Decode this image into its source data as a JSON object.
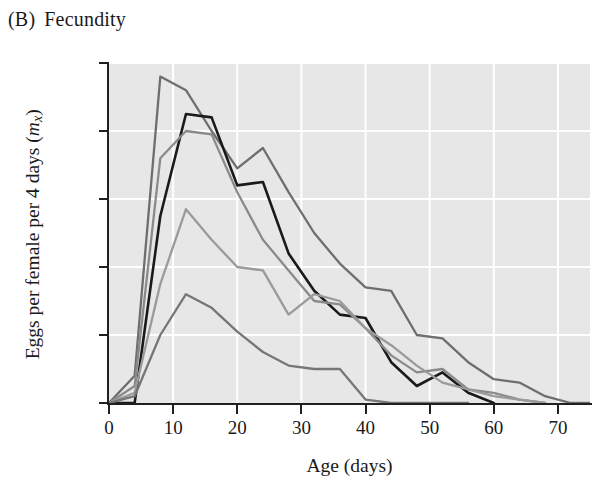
{
  "figure": {
    "panel_letter": "(B)",
    "panel_title": "Fecundity"
  },
  "axes": {
    "x_title": "Age (days)",
    "y_title_main": "Eggs per female per 4 days (",
    "y_title_symbol": "m",
    "y_title_subscript": "x",
    "y_title_close": ")",
    "x_ticks": [
      "0",
      "10",
      "20",
      "30",
      "40",
      "50",
      "60",
      "70"
    ],
    "y_ticks": [
      "0",
      "20",
      "40",
      "60",
      "80",
      "100"
    ]
  },
  "colors": {
    "plot_background": "#e7e7e7",
    "gridline": "#ffffff",
    "axis": "#202020",
    "series_1": "#6e6e6e",
    "series_2": "#1a1a1a",
    "series_3": "#8a8a8a",
    "series_4": "#9a9a9a",
    "series_5": "#767676"
  },
  "chart_data": {
    "type": "line",
    "xlabel": "Age (days)",
    "ylabel": "Eggs per female per 4 days (mx)",
    "xlim": [
      0,
      75
    ],
    "ylim": [
      0,
      100
    ],
    "xticks": [
      0,
      10,
      20,
      30,
      40,
      50,
      60,
      70
    ],
    "yticks": [
      0,
      20,
      40,
      60,
      80,
      100
    ],
    "grid": true,
    "legend": "none",
    "series": [
      {
        "name": "Population 1",
        "color": "#6e6e6e",
        "x": [
          0,
          4,
          8,
          12,
          16,
          20,
          24,
          28,
          32,
          36,
          40,
          44,
          48,
          52,
          56,
          60,
          64,
          68,
          72,
          75
        ],
        "y": [
          0,
          8,
          96,
          92,
          80,
          69,
          75,
          62,
          50,
          41,
          34,
          33,
          20,
          19,
          12,
          7,
          6,
          2,
          0,
          0
        ]
      },
      {
        "name": "Population 2",
        "color": "#1a1a1a",
        "x": [
          0,
          4,
          8,
          12,
          16,
          20,
          24,
          28,
          32,
          36,
          40,
          44,
          48,
          52,
          56,
          60
        ],
        "y": [
          0,
          0,
          55,
          85,
          84,
          64,
          65,
          44,
          33,
          26,
          25,
          12,
          5,
          9,
          3,
          0
        ]
      },
      {
        "name": "Population 3",
        "color": "#8a8a8a",
        "x": [
          0,
          4,
          8,
          12,
          16,
          20,
          24,
          28,
          32,
          36,
          40,
          44,
          48,
          52,
          56,
          60,
          64,
          68
        ],
        "y": [
          0,
          5,
          72,
          80,
          79,
          62,
          48,
          39,
          30,
          29,
          22,
          14,
          9,
          10,
          4,
          3,
          1,
          0
        ]
      },
      {
        "name": "Population 4",
        "color": "#9a9a9a",
        "x": [
          0,
          4,
          8,
          12,
          16,
          20,
          24,
          28,
          32,
          36,
          40,
          44,
          48,
          52,
          56,
          60,
          64,
          68
        ],
        "y": [
          0,
          3,
          35,
          57,
          48,
          40,
          39,
          26,
          32,
          30,
          22,
          17,
          11,
          6,
          4,
          2,
          1,
          0
        ]
      },
      {
        "name": "Population 5",
        "color": "#767676",
        "x": [
          0,
          4,
          8,
          12,
          16,
          20,
          24,
          28,
          32,
          36,
          40,
          44,
          48,
          52,
          56
        ],
        "y": [
          0,
          2,
          20,
          32,
          28,
          21,
          15,
          11,
          10,
          10,
          1,
          0,
          0,
          0,
          0
        ]
      }
    ]
  }
}
